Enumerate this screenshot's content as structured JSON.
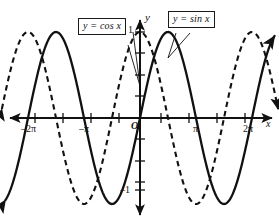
{
  "figure": {
    "background_color": "#ffffff",
    "ink_color": "#111111"
  },
  "callouts": [
    {
      "id": "cos",
      "label": "y = cos x",
      "target_curve": "cosine"
    },
    {
      "id": "sin",
      "label": "y = sin x",
      "target_curve": "sine"
    }
  ],
  "labels": {
    "y_axis": "y",
    "x_axis": "x",
    "origin": "O",
    "y_one": "1",
    "y_neg_one": "–1"
  },
  "x_ticks": [
    {
      "label": "–2π",
      "value": -6.2832
    },
    {
      "label": "–π",
      "value": -3.1416
    },
    {
      "label": "π",
      "value": 3.1416
    },
    {
      "label": "2π",
      "value": 6.2832
    }
  ],
  "chart_data": {
    "type": "line",
    "title": "",
    "xlabel": "x",
    "ylabel": "y",
    "xlim": [
      -8.2,
      8.2
    ],
    "ylim": [
      -1.35,
      1.35
    ],
    "grid": false,
    "legend": "callout-boxes",
    "x_tick_values": [
      -6.2832,
      -4.7124,
      -3.1416,
      -1.5708,
      0,
      1.5708,
      3.1416,
      4.7124,
      6.2832
    ],
    "x_tick_labels": [
      "–2π",
      "",
      "–π",
      "",
      "",
      "",
      "π",
      "",
      "2π"
    ],
    "y_tick_values": [
      -1,
      -0.75,
      -0.5,
      -0.25,
      0,
      0.25,
      0.5,
      0.75,
      1
    ],
    "y_tick_labels": [
      "–1",
      "",
      "",
      "",
      "",
      "",
      "",
      "",
      "1"
    ],
    "series": [
      {
        "name": "y = sin x",
        "style": "solid",
        "color": "#111111",
        "function": "sin",
        "amplitude": 1,
        "period": 6.2832,
        "arrows": [
          "start-down-left",
          "end-up-right"
        ],
        "key_points": [
          {
            "x": -6.2832,
            "y": 0
          },
          {
            "x": -4.7124,
            "y": -1
          },
          {
            "x": -3.1416,
            "y": 0
          },
          {
            "x": -1.5708,
            "y": 1
          },
          {
            "x": 0,
            "y": 0
          },
          {
            "x": 1.5708,
            "y": 1
          },
          {
            "x": 3.1416,
            "y": 0
          },
          {
            "x": 4.7124,
            "y": -1
          },
          {
            "x": 6.2832,
            "y": 0
          }
        ]
      },
      {
        "name": "y = cos x",
        "style": "dashed",
        "color": "#111111",
        "function": "cos",
        "amplitude": 1,
        "period": 6.2832,
        "arrows": [
          "start-down-left",
          "end-down-right"
        ],
        "key_points": [
          {
            "x": -6.2832,
            "y": 1
          },
          {
            "x": -4.7124,
            "y": 0
          },
          {
            "x": -3.1416,
            "y": -1
          },
          {
            "x": -1.5708,
            "y": 0
          },
          {
            "x": 0,
            "y": 1
          },
          {
            "x": 1.5708,
            "y": 0
          },
          {
            "x": 3.1416,
            "y": -1
          },
          {
            "x": 4.7124,
            "y": 0
          },
          {
            "x": 6.2832,
            "y": 1
          }
        ]
      }
    ]
  }
}
